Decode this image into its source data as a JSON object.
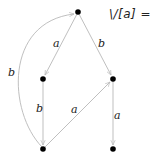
{
  "title": "\\/[a] =",
  "colors": {
    "edge": "#b8b8b8",
    "node": "#000000",
    "label": "#222222"
  },
  "nodes": [
    {
      "id": "top",
      "x": 78,
      "y": 12
    },
    {
      "id": "mid-left",
      "x": 43,
      "y": 79
    },
    {
      "id": "mid-right",
      "x": 113,
      "y": 79
    },
    {
      "id": "bottom-left",
      "x": 43,
      "y": 149
    },
    {
      "id": "bottom-right",
      "x": 113,
      "y": 149
    }
  ],
  "edges": [
    {
      "from": "top",
      "to": "mid-left",
      "label": "a"
    },
    {
      "from": "top",
      "to": "mid-right",
      "label": "b"
    },
    {
      "from": "mid-left",
      "to": "bottom-left",
      "label": "b"
    },
    {
      "from": "bottom-left",
      "to": "mid-right",
      "label": "a"
    },
    {
      "from": "mid-right",
      "to": "bottom-right",
      "label": "a"
    },
    {
      "from": "bottom-left",
      "to": "top",
      "label": "b",
      "curved": true
    }
  ]
}
